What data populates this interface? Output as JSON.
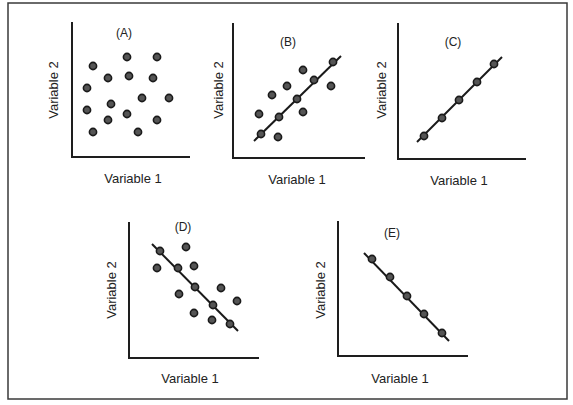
{
  "figure": {
    "frame": {
      "x": 8,
      "y": 3,
      "width": 559,
      "height": 396
    },
    "dot_radius": 3.6
  },
  "panels": [
    {
      "id": "A",
      "label": "(A)",
      "xlabel": "Variable 1",
      "ylabel": "Variable 2",
      "axes": {
        "x0": 72,
        "ytop": 22,
        "ybase": 157,
        "xend": 190
      },
      "label_pos": {
        "x": 124,
        "y": 37
      },
      "xlabel_pos": {
        "x": 133,
        "y": 183
      },
      "ylabel_pos": {
        "x": 55,
        "y": 90
      },
      "fit_line": null,
      "points": [
        [
          93,
          66
        ],
        [
          127,
          57
        ],
        [
          157,
          57
        ],
        [
          108,
          78
        ],
        [
          129,
          76
        ],
        [
          153,
          78
        ],
        [
          87,
          88
        ],
        [
          142,
          98
        ],
        [
          169,
          98
        ],
        [
          111,
          104
        ],
        [
          87,
          110
        ],
        [
          127,
          114
        ],
        [
          108,
          120
        ],
        [
          157,
          120
        ],
        [
          93,
          132
        ],
        [
          138,
          132
        ]
      ]
    },
    {
      "id": "B",
      "label": "(B)",
      "xlabel": "Variable 1",
      "ylabel": "Variable 2",
      "axes": {
        "x0": 233,
        "ytop": 23,
        "ybase": 158,
        "xend": 365
      },
      "label_pos": {
        "x": 288,
        "y": 46
      },
      "xlabel_pos": {
        "x": 297,
        "y": 184
      },
      "ylabel_pos": {
        "x": 220,
        "y": 90
      },
      "fit_line": [
        [
          254,
          141
        ],
        [
          341,
          56
        ]
      ],
      "points": [
        [
          261,
          134
        ],
        [
          279,
          117
        ],
        [
          297,
          99
        ],
        [
          314,
          80
        ],
        [
          333,
          62
        ],
        [
          259,
          114
        ],
        [
          272,
          95
        ],
        [
          287,
          86
        ],
        [
          303,
          70
        ],
        [
          331,
          86
        ],
        [
          303,
          112
        ],
        [
          278,
          137
        ]
      ]
    },
    {
      "id": "C",
      "label": "(C)",
      "xlabel": "Variable 1",
      "ylabel": "Variable 2",
      "axes": {
        "x0": 398,
        "ytop": 23,
        "ybase": 159,
        "xend": 526
      },
      "label_pos": {
        "x": 453,
        "y": 46
      },
      "xlabel_pos": {
        "x": 459,
        "y": 185
      },
      "ylabel_pos": {
        "x": 383,
        "y": 90
      },
      "fit_line": [
        [
          417,
          142
        ],
        [
          502,
          57
        ]
      ],
      "points": [
        [
          424,
          136
        ],
        [
          442,
          118
        ],
        [
          459,
          100
        ],
        [
          477,
          82
        ],
        [
          494,
          64
        ]
      ]
    },
    {
      "id": "D",
      "label": "(D)",
      "xlabel": "Variable 1",
      "ylabel": "Variable 2",
      "axes": {
        "x0": 129,
        "ytop": 222,
        "ybase": 358,
        "xend": 259
      },
      "label_pos": {
        "x": 183,
        "y": 231
      },
      "xlabel_pos": {
        "x": 190,
        "y": 383
      },
      "ylabel_pos": {
        "x": 113,
        "y": 290
      },
      "fit_line": [
        [
          152,
          244
        ],
        [
          238,
          331
        ]
      ],
      "points": [
        [
          160,
          251
        ],
        [
          178,
          268
        ],
        [
          195,
          287
        ],
        [
          213,
          305
        ],
        [
          230,
          324
        ],
        [
          186,
          247
        ],
        [
          157,
          268
        ],
        [
          194,
          266
        ],
        [
          179,
          294
        ],
        [
          221,
          288
        ],
        [
          237,
          301
        ],
        [
          194,
          313
        ],
        [
          212,
          320
        ]
      ]
    },
    {
      "id": "E",
      "label": "(E)",
      "xlabel": "Variable 1",
      "ylabel": "Variable 2",
      "axes": {
        "x0": 338,
        "ytop": 221,
        "ybase": 356,
        "xend": 468
      },
      "label_pos": {
        "x": 392,
        "y": 237
      },
      "xlabel_pos": {
        "x": 400,
        "y": 383
      },
      "ylabel_pos": {
        "x": 322,
        "y": 290
      },
      "fit_line": [
        [
          364,
          253
        ],
        [
          449,
          341
        ]
      ],
      "points": [
        [
          372,
          259
        ],
        [
          390,
          277
        ],
        [
          407,
          296
        ],
        [
          424,
          314
        ],
        [
          442,
          333
        ]
      ]
    }
  ],
  "chart_data": [
    {
      "type": "scatter",
      "title": "(A)",
      "xlabel": "Variable 1",
      "ylabel": "Variable 2",
      "description": "No correlation: points scattered with no trend",
      "correlation": "none",
      "fit_line": false,
      "grid": false,
      "x": [
        1.1,
        2.9,
        4.5,
        1.9,
        3.0,
        4.3,
        0.8,
        3.7,
        5.2,
        2.1,
        0.8,
        2.9,
        1.9,
        4.5,
        1.1,
        3.5
      ],
      "y": [
        5.2,
        5.7,
        5.7,
        4.5,
        4.6,
        4.5,
        3.9,
        3.3,
        3.3,
        3.0,
        2.6,
        2.4,
        2.1,
        2.1,
        1.4,
        1.4
      ]
    },
    {
      "type": "scatter",
      "title": "(B)",
      "xlabel": "Variable 1",
      "ylabel": "Variable 2",
      "description": "Moderate positive correlation with best-fit line",
      "correlation": "moderate positive",
      "fit_line": true,
      "grid": false,
      "x": [
        1.2,
        2.1,
        3.0,
        3.9,
        4.9,
        1.1,
        1.8,
        2.6,
        3.4,
        4.8,
        3.4,
        2.0
      ],
      "y": [
        1.3,
        2.2,
        3.2,
        4.2,
        5.1,
        2.4,
        3.4,
        3.9,
        4.7,
        3.9,
        2.5,
        1.1
      ]
    },
    {
      "type": "scatter",
      "title": "(C)",
      "xlabel": "Variable 1",
      "ylabel": "Variable 2",
      "description": "Perfect positive correlation, all points on line",
      "correlation": "perfect positive",
      "fit_line": true,
      "grid": false,
      "x": [
        1,
        2,
        3,
        4,
        5
      ],
      "y": [
        1,
        2,
        3,
        4,
        5
      ]
    },
    {
      "type": "scatter",
      "title": "(D)",
      "xlabel": "Variable 1",
      "ylabel": "Variable 2",
      "description": "Moderate negative correlation with best-fit line",
      "correlation": "moderate negative",
      "fit_line": true,
      "grid": false,
      "x": [
        1.3,
        2.1,
        3.0,
        3.9,
        4.7,
        2.6,
        1.2,
        2.5,
        2.3,
        4.3,
        5.0,
        2.5,
        3.8
      ],
      "y": [
        5.6,
        4.7,
        3.7,
        2.8,
        1.7,
        5.8,
        4.7,
        4.8,
        3.3,
        3.6,
        2.9,
        2.4,
        2.0
      ]
    },
    {
      "type": "scatter",
      "title": "(E)",
      "xlabel": "Variable 1",
      "ylabel": "Variable 2",
      "description": "Perfect negative correlation, all points on line",
      "correlation": "perfect negative",
      "fit_line": true,
      "grid": false,
      "x": [
        1,
        2,
        3,
        4,
        5
      ],
      "y": [
        5,
        4,
        3,
        2,
        1
      ]
    }
  ]
}
